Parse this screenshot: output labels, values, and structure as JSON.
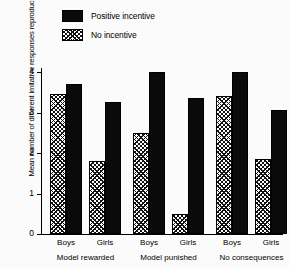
{
  "chart_data": {
    "type": "bar",
    "title": "",
    "xlabel": "",
    "ylabel": "Mean number of different imitative responses reproduced",
    "ylim": [
      0,
      4.3
    ],
    "yticks": [
      0,
      1,
      2,
      3,
      4
    ],
    "ytick_labels": [
      "0",
      "1",
      "2",
      "3",
      "4"
    ],
    "grid": false,
    "legend_position": "top-left",
    "categories": [
      "Boys",
      "Girls",
      "Boys",
      "Girls",
      "Boys",
      "Girls"
    ],
    "groups": [
      {
        "label": "Model rewarded",
        "subgroups": [
          {
            "label": "Boys",
            "no_incentive": 3.45,
            "positive_incentive": 3.7
          },
          {
            "label": "Girls",
            "no_incentive": 1.8,
            "positive_incentive": 3.25
          }
        ]
      },
      {
        "label": "Model punished",
        "subgroups": [
          {
            "label": "Boys",
            "no_incentive": 2.5,
            "positive_incentive": 4.0
          },
          {
            "label": "Girls",
            "no_incentive": 0.5,
            "positive_incentive": 3.35
          }
        ]
      },
      {
        "label": "No consequences",
        "subgroups": [
          {
            "label": "Boys",
            "no_incentive": 3.4,
            "positive_incentive": 4.0
          },
          {
            "label": "Girls",
            "no_incentive": 1.85,
            "positive_incentive": 3.05
          }
        ]
      }
    ],
    "series": [
      {
        "name": "Positive incentive",
        "pattern": "solid",
        "color": "#0a0a0a",
        "values": [
          3.7,
          3.25,
          4.0,
          3.35,
          4.0,
          3.05
        ]
      },
      {
        "name": "No incentive",
        "pattern": "hatch",
        "color": "#ffffff",
        "values": [
          3.45,
          1.8,
          2.5,
          0.5,
          3.4,
          1.85
        ]
      }
    ]
  },
  "legend": {
    "items": [
      {
        "label": "Positive incentive",
        "pattern": "solid"
      },
      {
        "label": "No incentive",
        "pattern": "hatch"
      }
    ]
  }
}
